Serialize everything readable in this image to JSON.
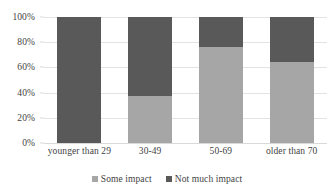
{
  "chart_data": {
    "type": "bar",
    "subtype": "100% stacked bar",
    "title": "",
    "xlabel": "",
    "ylabel": "",
    "ylim": [
      0,
      100
    ],
    "yticks": [
      "0%",
      "20%",
      "40%",
      "60%",
      "80%",
      "100%"
    ],
    "ytick_values": [
      0,
      20,
      40,
      60,
      80,
      100
    ],
    "grid": true,
    "legend_position": "bottom-center",
    "categories": [
      "younger than 29",
      "30-49",
      "50-69",
      "older than 70"
    ],
    "series": [
      {
        "name": "Some impact",
        "color": "#a6a6a6",
        "values": [
          0,
          37,
          76,
          64
        ]
      },
      {
        "name": "Not much impact",
        "color": "#595959",
        "values": [
          100,
          63,
          24,
          36
        ]
      }
    ]
  },
  "axis": {
    "y_ticks": [
      {
        "label": "100%",
        "value": 100
      },
      {
        "label": "80%",
        "value": 80
      },
      {
        "label": "60%",
        "value": 60
      },
      {
        "label": "40%",
        "value": 40
      },
      {
        "label": "20%",
        "value": 20
      },
      {
        "label": "0%",
        "value": 0
      }
    ]
  },
  "legend": {
    "items": [
      {
        "label": "Some impact",
        "color": "#a6a6a6",
        "marker": "square-swatch-icon"
      },
      {
        "label": "Not much impact",
        "color": "#595959",
        "marker": "square-swatch-icon"
      }
    ]
  },
  "colors": {
    "some_impact": "#a6a6a6",
    "not_much_impact": "#595959",
    "gridline": "#e3e3e3",
    "text": "#3f3f3f",
    "background": "#ffffff"
  }
}
